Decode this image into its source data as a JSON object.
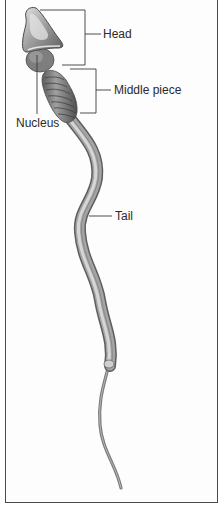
{
  "diagram": {
    "labels": [
      {
        "id": "head",
        "text": "Head"
      },
      {
        "id": "middle_piece",
        "text": "Middle piece"
      },
      {
        "id": "nucleus",
        "text": "Nucleus"
      },
      {
        "id": "tail",
        "text": "Tail"
      }
    ]
  },
  "colors": {
    "frame": "#4a4a4a",
    "leader_lines": "#3a3a3a",
    "text": "#2a2a2a",
    "cell_body": "#9a9a9a",
    "cell_highlight": "#d8d8d8",
    "cell_shadow": "#5a5a5a"
  }
}
